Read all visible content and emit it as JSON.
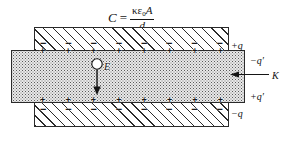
{
  "figure": {
    "formula": {
      "lhs": "C",
      "equals": "=",
      "kappa": "κ",
      "epsilon": "ε",
      "epsilon_subscript": "0",
      "area": "A",
      "denominator": "d"
    },
    "field": {
      "label": "E",
      "direction": "down"
    },
    "labels": {
      "free_charge_top": "+q",
      "induced_charge_top": "−q′",
      "dielectric_constant": "K",
      "induced_charge_bottom": "+q′",
      "free_charge_bottom": "−q"
    },
    "signs": {
      "top_plate": [
        "−",
        "−",
        "−",
        "−",
        "−",
        "−",
        "−",
        "−"
      ],
      "upper_dielectric": [
        "+",
        "+",
        "+",
        "+",
        "+",
        "+",
        "+",
        "+"
      ],
      "lower_dielectric": [
        "+",
        "+",
        "+",
        "+",
        "+",
        "+",
        "+",
        "+"
      ],
      "bottom_plate": [
        "−",
        "−",
        "−",
        "−",
        "−",
        "−",
        "−",
        "−"
      ]
    },
    "colors": {
      "ink": "#1a1a1a",
      "plate_fill": "#ffffff",
      "dielectric_fill": "#e9e9e9",
      "outline": "#2a2a2a"
    }
  }
}
